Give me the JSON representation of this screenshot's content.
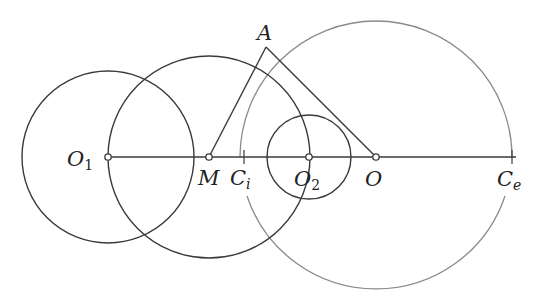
{
  "diagram": {
    "type": "geometry-construction",
    "baseline": {
      "y": 157,
      "x_start": 108,
      "x_end": 512
    },
    "colors": {
      "dark": "#3a3a3a",
      "gray": "#8a8a8a",
      "point_fill": "#ffffff"
    },
    "points": {
      "O1": {
        "x": 108,
        "y": 157,
        "label": "O",
        "sub": "1"
      },
      "M": {
        "x": 209,
        "y": 157,
        "label": "M",
        "sub": ""
      },
      "O2": {
        "x": 309,
        "y": 157,
        "label": "O",
        "sub": "2"
      },
      "O": {
        "x": 376,
        "y": 157,
        "label": "O",
        "sub": ""
      },
      "A": {
        "x": 266,
        "y": 47,
        "label": "A",
        "sub": ""
      },
      "Ci": {
        "x": 240,
        "y": 157,
        "label": "C",
        "sub": "i"
      },
      "Ce": {
        "x": 512,
        "y": 157,
        "label": "C",
        "sub": "e"
      }
    },
    "circles": [
      {
        "name": "circle-O1",
        "cx": 108,
        "cy": 157,
        "r": 86,
        "color": "dark"
      },
      {
        "name": "circle-M",
        "cx": 209,
        "cy": 157,
        "r": 101,
        "color": "dark"
      },
      {
        "name": "circle-O2",
        "cx": 309,
        "cy": 157,
        "r": 42,
        "color": "dark"
      },
      {
        "name": "circle-O",
        "cx": 376,
        "cy": 157,
        "r": 136,
        "color": "gray"
      }
    ],
    "segments": [
      {
        "name": "segment-MA",
        "from": "M",
        "to": "A"
      },
      {
        "name": "segment-AO",
        "from": "A",
        "to": "O"
      }
    ]
  }
}
